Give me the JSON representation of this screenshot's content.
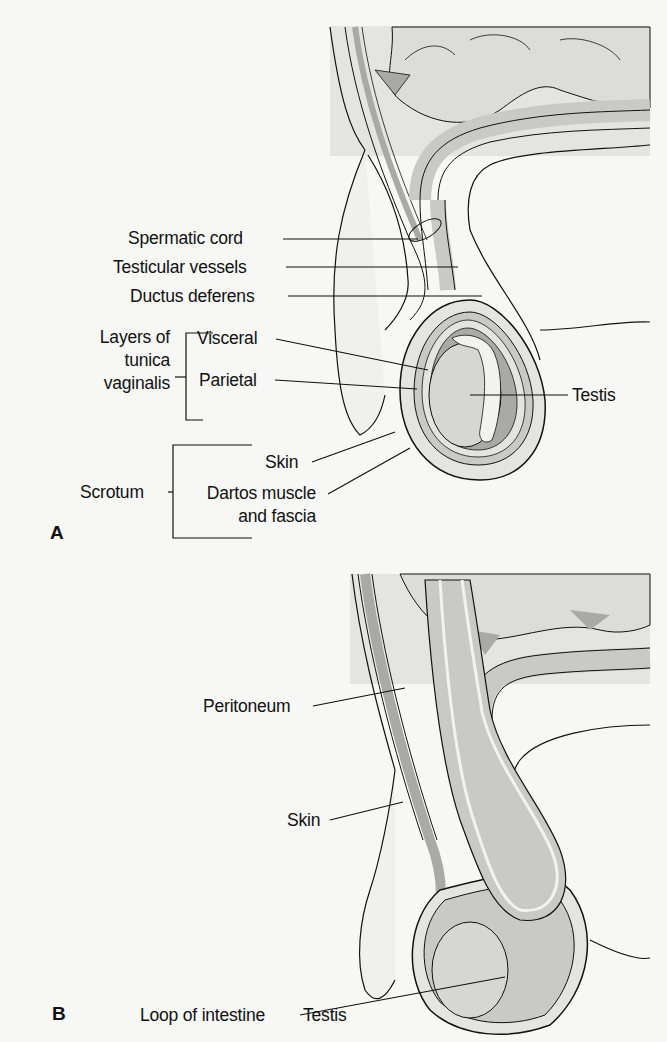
{
  "figure": {
    "panel_a": {
      "letter": "A",
      "labels": {
        "spermatic_cord": "Spermatic cord",
        "testicular_vessels": "Testicular vessels",
        "ductus_deferens": "Ductus deferens",
        "layers_group_line1": "Layers of",
        "layers_group_line2": "tunica",
        "layers_group_line3": "vaginalis",
        "visceral": "Visceral",
        "parietal": "Parietal",
        "testis": "Testis",
        "scrotum": "Scrotum",
        "skin": "Skin",
        "dartos_line1": "Dartos muscle",
        "dartos_line2": "and fascia"
      }
    },
    "panel_b": {
      "letter": "B",
      "labels": {
        "peritoneum": "Peritoneum",
        "skin": "Skin",
        "loop_of_intestine": "Loop of intestine",
        "testis": "Testis"
      }
    },
    "colors": {
      "background": "#f7f7f5",
      "tissue_light": "#e4e4e2",
      "tissue_mid": "#c9c9c7",
      "tissue_dark": "#a9a9a7",
      "line": "#111111"
    }
  }
}
